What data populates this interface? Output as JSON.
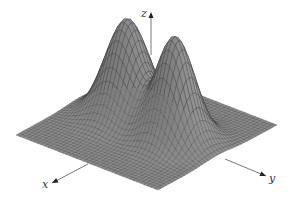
{
  "chart_data": {
    "type": "surface",
    "title": "",
    "axes": {
      "x_label": "x",
      "y_label": "y",
      "z_label": "z"
    },
    "grid": {
      "resolution": 40
    },
    "peaks": [
      {
        "name": "left peak",
        "s": 0.45,
        "t": 0.32,
        "height": 98,
        "width": 0.12
      },
      {
        "name": "right peak",
        "s": 0.5,
        "t": 0.7,
        "height": 104,
        "width": 0.11
      }
    ],
    "ticks": "none",
    "legend": "none",
    "colors": {
      "surface": "#8c8c8c",
      "surface_dark": "#5a5a5a",
      "mesh": "#2e2e2e",
      "axis": "#555555",
      "background": "#ffffff"
    }
  },
  "projection": {
    "back": [
      135,
      70
    ],
    "left": [
      16,
      135
    ],
    "right": [
      277,
      125
    ]
  },
  "axis_lines": {
    "x": {
      "from": [
        88,
        164
      ],
      "to": [
        52,
        183
      ],
      "label_pos": [
        42,
        188
      ]
    },
    "y": {
      "from": [
        225,
        159
      ],
      "to": [
        266,
        176
      ],
      "label_pos": [
        269,
        182
      ]
    },
    "z": {
      "from": [
        151,
        55
      ],
      "to": [
        151,
        12
      ],
      "label_pos": [
        141,
        17
      ]
    }
  }
}
